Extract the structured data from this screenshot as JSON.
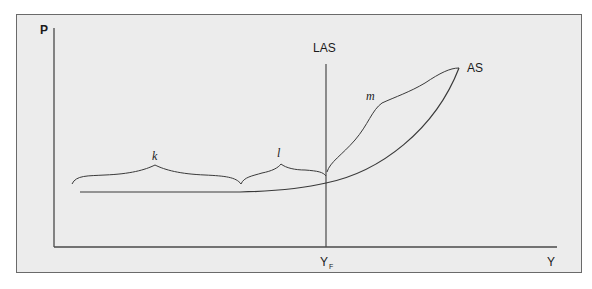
{
  "diagram": {
    "type": "aggregate-supply-diagram",
    "axes": {
      "y_label": "P",
      "x_label": "Y"
    },
    "curves": [
      {
        "id": "las",
        "label": "LAS",
        "shape": "vertical line at full-employment output"
      },
      {
        "id": "as",
        "label": "AS",
        "shape": "flat then rising steeply past Y_F"
      }
    ],
    "markers": {
      "full_employment_output": {
        "label": "Y",
        "subscript": "F"
      }
    },
    "ranges": [
      {
        "id": "k",
        "label": "k",
        "description": "horizontal section of AS"
      },
      {
        "id": "l",
        "label": "l",
        "description": "gently rising section of AS up to Y_F"
      },
      {
        "id": "m",
        "label": "m",
        "description": "steep section of AS beyond Y_F"
      }
    ],
    "colors": {
      "background": "#ececec",
      "frame_border": "#6a6a6a",
      "line": "#3a3a3a",
      "text": "#1a1a1a"
    }
  }
}
